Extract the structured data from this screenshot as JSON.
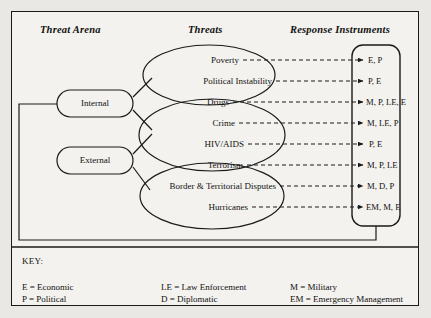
{
  "figure": {
    "columns": [
      {
        "id": "threat-arena",
        "title": "Threat Arena"
      },
      {
        "id": "threats",
        "title": "Threats"
      },
      {
        "id": "response-instruments",
        "title": "Response Instruments"
      }
    ],
    "arenas": [
      {
        "id": "internal",
        "label": "Internal"
      },
      {
        "id": "external",
        "label": "External"
      }
    ],
    "threats": [
      {
        "id": "poverty",
        "label": "Poverty",
        "group": 1
      },
      {
        "id": "political-instability",
        "label": "Political Instability",
        "group": 1
      },
      {
        "id": "drugs",
        "label": "Drugs",
        "group": 2
      },
      {
        "id": "crime",
        "label": "Crime",
        "group": 2
      },
      {
        "id": "hiv-aids",
        "label": "HIV/AIDS",
        "group": 2
      },
      {
        "id": "terrorism",
        "label": "Terrorism",
        "group": 3
      },
      {
        "id": "border-territorial-disputes",
        "label": "Border & Territorial Disputes",
        "group": 3
      },
      {
        "id": "hurricanes",
        "label": "Hurricanes",
        "group": 3
      }
    ],
    "responses": [
      {
        "id": "poverty-response",
        "label": "E, P"
      },
      {
        "id": "political-instability-response",
        "label": "P, E"
      },
      {
        "id": "drugs-response",
        "label": "M, P, LE, E"
      },
      {
        "id": "crime-response",
        "label": "M, LE, P"
      },
      {
        "id": "hiv-aids-response",
        "label": "P, E"
      },
      {
        "id": "terrorism-response",
        "label": "M, P, LE"
      },
      {
        "id": "border-territorial-disputes-response",
        "label": "M, D, P"
      },
      {
        "id": "hurricanes-response",
        "label": "EM, M, E"
      }
    ],
    "key": {
      "title": "KEY:",
      "entries": [
        {
          "id": "economic",
          "text": "E = Economic"
        },
        {
          "id": "law-enforcement",
          "text": "LE = Law Enforcement"
        },
        {
          "id": "military",
          "text": "M  =  Military"
        },
        {
          "id": "political",
          "text": "P  =  Political"
        },
        {
          "id": "diplomatic",
          "text": "D = Diplomatic"
        },
        {
          "id": "emergency-management",
          "text": "EM = Emergency Management"
        }
      ]
    },
    "colors": {
      "ink": "#1a1a1a",
      "paper": "#f3f2ee",
      "page": "#e9e8e4"
    }
  }
}
